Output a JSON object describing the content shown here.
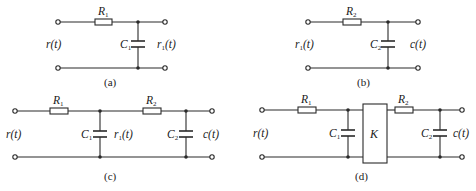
{
  "figure": {
    "panels": [
      {
        "id": "a",
        "caption": "(a)",
        "input_label": "r(t)",
        "output_label": "r",
        "output_sub": "1",
        "output_tail": "(t)",
        "resistor": {
          "name": "R",
          "sub": "1"
        },
        "capacitor": {
          "name": "C",
          "sub": "1"
        }
      },
      {
        "id": "b",
        "caption": "(b)",
        "input_label": "r",
        "input_sub": "1",
        "input_tail": "(t)",
        "output_label": "c(t)",
        "resistor": {
          "name": "R",
          "sub": "2"
        },
        "capacitor": {
          "name": "C",
          "sub": "2"
        }
      },
      {
        "id": "c",
        "caption": "(c)",
        "input_label": "r(t)",
        "mid_label": "r",
        "mid_sub": "1",
        "mid_tail": "(t)",
        "output_label": "c(t)",
        "resistors": [
          {
            "name": "R",
            "sub": "1"
          },
          {
            "name": "R",
            "sub": "2"
          }
        ],
        "capacitors": [
          {
            "name": "C",
            "sub": "1"
          },
          {
            "name": "C",
            "sub": "2"
          }
        ]
      },
      {
        "id": "d",
        "caption": "(d)",
        "input_label": "r(t)",
        "output_label": "c(t)",
        "block_label": "K",
        "resistors": [
          {
            "name": "R",
            "sub": "1"
          },
          {
            "name": "R",
            "sub": "2"
          }
        ],
        "capacitors": [
          {
            "name": "C",
            "sub": "1"
          },
          {
            "name": "C",
            "sub": "2"
          }
        ]
      }
    ]
  }
}
